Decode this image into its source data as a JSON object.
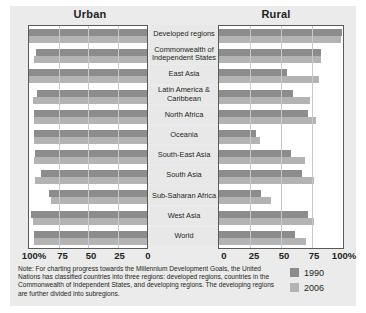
{
  "panels": {
    "left_title": "Urban",
    "right_title": "Rural"
  },
  "axis": {
    "left_ticks": [
      "100%",
      "75",
      "50",
      "25",
      "0"
    ],
    "right_ticks": [
      "0",
      "25",
      "50",
      "75",
      "100%"
    ]
  },
  "legend": {
    "items": [
      {
        "label": "1990",
        "color": "#8c8c8c"
      },
      {
        "label": "2006",
        "color": "#b3b3b3"
      }
    ]
  },
  "note": "Note: For charting progress towards the Millennium Development Goals, the United Nations has classified countries into three regions: developed regions, countries in the Commonwealth of Independent States, and developing regions. The developing regions are further divided into subregions.",
  "chart_data": {
    "type": "bar",
    "title": "",
    "xlabel": "",
    "ylabel": "",
    "orientation": "horizontal",
    "layout": "back-to-back paired panels",
    "panels": [
      "Urban",
      "Rural"
    ],
    "xlim": [
      0,
      100
    ],
    "grid": true,
    "legend_position": "bottom-right",
    "categories": [
      "Developed regions",
      "Commonwealth of Independent States",
      "East Asia",
      "Latin America & Caribbean",
      "North Africa",
      "Oceania",
      "South-East Asia",
      "South Asia",
      "Sub-Saharan Africa",
      "West Asia",
      "World"
    ],
    "series": [
      {
        "name": "Urban 1990",
        "panel": "Urban",
        "year": "1990",
        "color": "#8c8c8c",
        "values": [
          100,
          94,
          100,
          93,
          96,
          96,
          95,
          90,
          83,
          98,
          96
        ]
      },
      {
        "name": "Urban 2006",
        "panel": "Urban",
        "year": "2006",
        "color": "#b3b3b3",
        "values": [
          100,
          96,
          100,
          97,
          96,
          96,
          96,
          95,
          81,
          97,
          96
        ]
      },
      {
        "name": "Rural 1990",
        "panel": "Rural",
        "year": "1990",
        "color": "#8c8c8c",
        "values": [
          99,
          82,
          55,
          60,
          72,
          30,
          58,
          67,
          34,
          72,
          61
        ]
      },
      {
        "name": "Rural 2006",
        "panel": "Rural",
        "year": "2006",
        "color": "#b3b3b3",
        "values": [
          98,
          82,
          81,
          73,
          78,
          33,
          69,
          77,
          42,
          77,
          70
        ]
      }
    ]
  }
}
